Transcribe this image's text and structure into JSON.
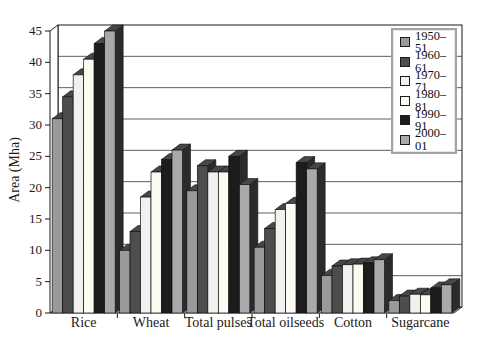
{
  "figure_name": "crop-area-3d-bar-chart",
  "chart_data": {
    "type": "bar",
    "variant": "3d-grouped",
    "title": "",
    "xlabel": "",
    "ylabel": "Area (Mha)",
    "ylim": [
      0,
      45
    ],
    "ytick_step": 5,
    "yticks": [
      0,
      5,
      10,
      15,
      20,
      25,
      30,
      35,
      40,
      45
    ],
    "grid": true,
    "legend_position": "top-right",
    "categories": [
      "Rice",
      "Wheat",
      "Total pulses",
      "Total oilseeds",
      "Cotton",
      "Sugarcane"
    ],
    "series": [
      {
        "name": "1950–51",
        "color": "#9a9a9a",
        "values": [
          31.0,
          10.0,
          19.5,
          10.5,
          6.0,
          2.0
        ]
      },
      {
        "name": "1960–61",
        "color": "#4d4d4d",
        "values": [
          34.5,
          13.0,
          23.5,
          13.5,
          7.5,
          2.7
        ]
      },
      {
        "name": "1970–71",
        "color": "#f1f1ef",
        "values": [
          38.0,
          18.5,
          22.5,
          16.5,
          7.7,
          3.0
        ]
      },
      {
        "name": "1980–81",
        "color": "#fbfbf1",
        "values": [
          40.5,
          22.5,
          22.5,
          17.5,
          7.8,
          2.9
        ]
      },
      {
        "name": "1990–91",
        "color": "#1c1c1c",
        "values": [
          43.0,
          24.5,
          25.0,
          24.0,
          8.0,
          4.0
        ]
      },
      {
        "name": "2000–01",
        "color": "#a9a9a9",
        "values": [
          45.0,
          26.0,
          20.5,
          23.0,
          8.5,
          4.5
        ]
      }
    ],
    "colors": {
      "axis_line": "#1a1a1a",
      "grid_line": "#1a1a1a",
      "wall_fill": "#ffffff",
      "floor_fill": "#b3b3b3",
      "bar_top_shade": "#474747",
      "bar_side_shade": "#2b2b2b",
      "text": "#1a1a1a",
      "legend_border": "#a3a3a3"
    }
  }
}
